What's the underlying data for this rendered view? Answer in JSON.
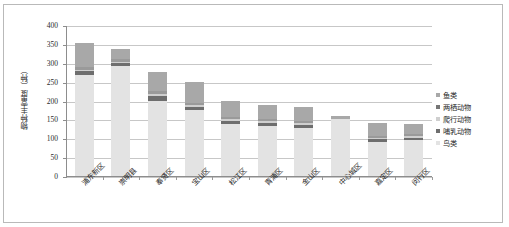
{
  "chart_data": {
    "type": "bar",
    "subtype": "stacked-bar",
    "title": "",
    "xlabel": "",
    "ylabel": "物种丰富度（种）",
    "ylim": [
      0,
      400
    ],
    "ytick_step": 50,
    "yticks": [
      400,
      350,
      300,
      250,
      200,
      150,
      100,
      50,
      0
    ],
    "grid": true,
    "legend_position": "right",
    "categories": [
      "浦东新区",
      "崇明县",
      "奉贤区",
      "宝山区",
      "松江区",
      "青浦区",
      "金山区",
      "中心城区",
      "嘉定区",
      "闵行区"
    ],
    "series": [
      {
        "name": "鸟类",
        "color": "#e3e3e3",
        "values": [
          268,
          292,
          200,
          175,
          138,
          133,
          128,
          150,
          90,
          95
        ]
      },
      {
        "name": "哺乳动物",
        "color": "#6e6e6e",
        "values": [
          9,
          7,
          12,
          8,
          8,
          8,
          8,
          0,
          7,
          7
        ]
      },
      {
        "name": "爬行动物",
        "color": "#cfcfcf",
        "values": [
          5,
          4,
          5,
          4,
          4,
          4,
          4,
          0,
          4,
          4
        ]
      },
      {
        "name": "两栖动物",
        "color": "#9a9a9a",
        "values": [
          8,
          6,
          7,
          6,
          6,
          6,
          6,
          0,
          6,
          6
        ]
      },
      {
        "name": "鱼类",
        "color": "#a8a8a8",
        "values": [
          62,
          27,
          51,
          57,
          42,
          36,
          36,
          8,
          33,
          26
        ]
      }
    ],
    "totals": [
      352,
      336,
      275,
      250,
      198,
      187,
      182,
      158,
      140,
      138
    ]
  },
  "legend": {
    "items": [
      {
        "label": "鱼类",
        "color": "#a8a8a8"
      },
      {
        "label": "两栖动物",
        "color": "#767676"
      },
      {
        "label": "爬行动物",
        "color": "#cfcfcf"
      },
      {
        "label": "哺乳动物",
        "color": "#6e6e6e"
      },
      {
        "label": "鸟类",
        "color": "#e3e3e3"
      }
    ]
  }
}
